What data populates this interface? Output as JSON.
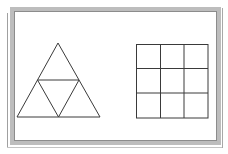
{
  "diagram": {
    "colors": {
      "background": "#ffffff",
      "frame_outer_line": "#9a9a9a",
      "frame_band": "#b8b8b8",
      "frame_inner_line": "#8a8a8a",
      "shape_stroke": "#3a3a3a"
    },
    "frame": {
      "outer_left_line_x": 7,
      "band": {
        "x": 11,
        "y": 8,
        "width": 207,
        "height": 134,
        "thickness": 4
      }
    },
    "triangle": {
      "apex": [
        58,
        43
      ],
      "base_left": [
        17,
        117
      ],
      "base_right": [
        100,
        117
      ],
      "midline_left": [
        37.5,
        80
      ],
      "midline_right": [
        79,
        80
      ],
      "base_mid": [
        58.5,
        117
      ],
      "subdivisions": 4
    },
    "grid": {
      "x": 136,
      "y": 44,
      "width": 72,
      "height": 74,
      "rows": 3,
      "cols": 3
    }
  }
}
